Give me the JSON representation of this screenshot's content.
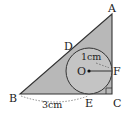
{
  "diagram": {
    "type": "right triangle with inscribed circle",
    "colors": {
      "triangle_fill": "#b8b8b8",
      "circle_fill": "#c8c8c8",
      "stroke": "#333333",
      "background": "#ffffff"
    },
    "points": {
      "A": {
        "label": "A",
        "x": 112,
        "y": 14
      },
      "B": {
        "label": "B",
        "x": 20,
        "y": 94
      },
      "C": {
        "label": "C",
        "x": 112,
        "y": 94
      },
      "D": {
        "label": "D",
        "x": 70,
        "y": 48
      },
      "E": {
        "label": "E",
        "x": 89,
        "y": 94
      },
      "F": {
        "label": "F",
        "x": 112,
        "y": 71
      },
      "O": {
        "label": "O",
        "x": 89,
        "y": 71
      }
    },
    "circle": {
      "center": "O",
      "radius_px": 23
    },
    "measurements": {
      "radius_label": "1cm",
      "BE_label": "3cm"
    },
    "right_angle_at": "C"
  }
}
